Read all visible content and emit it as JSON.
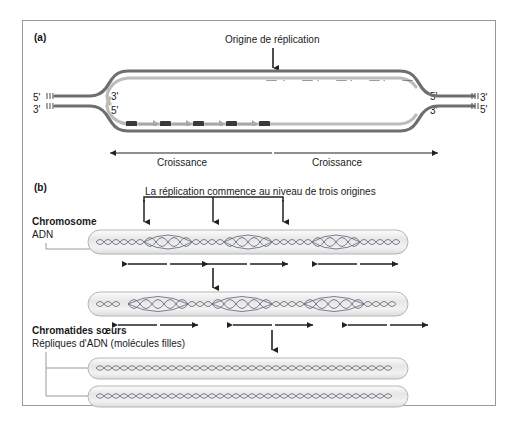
{
  "figure": {
    "panels": [
      {
        "id": "a",
        "label": "(a)"
      },
      {
        "id": "b",
        "label": "(b)"
      }
    ]
  },
  "panel_a": {
    "title": "Origine de réplication",
    "strand_ends": {
      "left_top": "5'",
      "left_bottom": "3'",
      "fork_left_top": "3'",
      "fork_left_bottom": "5'",
      "fork_right_top": "5'",
      "fork_right_bottom": "3'",
      "right_top": "3'",
      "right_bottom": "5'"
    },
    "growth_left": "Croissance",
    "growth_right": "Croissance",
    "colors": {
      "parental_strand": "#6e6e6e",
      "new_strand": "#b9b9b9",
      "okazaki_fragment": "#3a3a3a",
      "arrow": "#222222"
    },
    "okazaki": {
      "top_strand_count": 5,
      "bottom_strand_count": 5,
      "top_direction": "left",
      "bottom_direction": "right"
    }
  },
  "panel_b": {
    "title": "La réplication commence au niveau de trois origines",
    "origin_count": 3,
    "chromosome_label": "Chromosome",
    "dna_label": "ADN",
    "sister_chromatids_label": "Chromatides sœurs",
    "dna_replicas_label": "Répliques d'ADN (molécules filles)",
    "stages": [
      {
        "id": "stage-1",
        "bubbles": 3,
        "growth_arrow_pairs": 3
      },
      {
        "id": "stage-2",
        "bubbles": 3,
        "growth_arrow_pairs": 3
      },
      {
        "id": "stage-3",
        "chromatids": 2
      }
    ],
    "colors": {
      "chromosome_body": "#efefef",
      "chromosome_outline": "#b4b4b4",
      "dna_helix": "#6a7380",
      "arrow": "#222222",
      "leader_line": "#9a9a9a"
    }
  }
}
